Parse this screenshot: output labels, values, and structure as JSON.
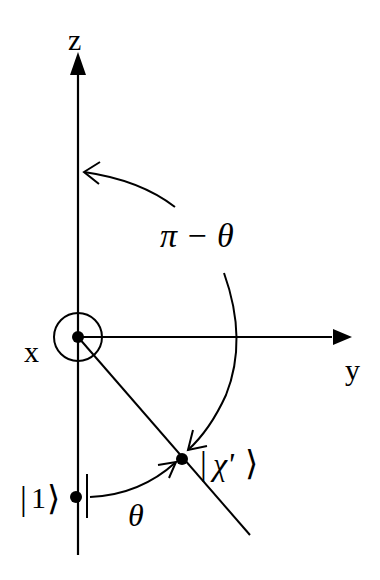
{
  "diagram": {
    "type": "bloch-sphere-rotation",
    "axes": {
      "z_label": "z",
      "y_label": "y",
      "x_label": "x"
    },
    "angles": {
      "upper_arc_label": "π − θ",
      "lower_arc_label": "θ"
    },
    "states": {
      "basis_state_label": "|1⟩",
      "basis_state_ket_inner": "1",
      "rotated_state_label": "|χ'⟩",
      "rotated_state_ket_inner": "χ'"
    },
    "colors": {
      "ink": "#000000",
      "background": "#ffffff"
    }
  }
}
